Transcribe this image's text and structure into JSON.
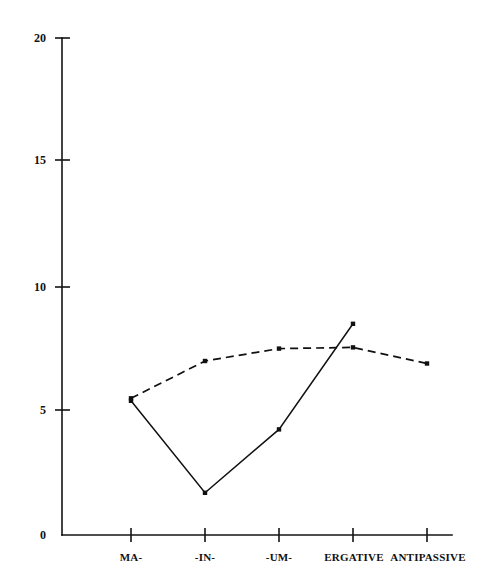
{
  "chart_data": {
    "type": "line",
    "title": "",
    "xlabel": "",
    "ylabel": "",
    "categories": [
      "MA-",
      "-IN-",
      "-UM-",
      "ERGATIVE",
      "ANTIPASSIVE"
    ],
    "ylim": [
      0,
      20
    ],
    "xlim": [
      0,
      5
    ],
    "yticks": [
      0,
      5,
      10,
      15,
      20
    ],
    "grid": false,
    "legend": "none",
    "series": [
      {
        "name": "solid",
        "style": "solid",
        "marker": "square",
        "values": [
          5.4,
          1.7,
          4.25,
          8.5,
          null
        ]
      },
      {
        "name": "dashed",
        "style": "dashed",
        "marker": "square",
        "values": [
          5.5,
          7.0,
          7.5,
          7.55,
          6.9
        ]
      }
    ]
  },
  "axis": {
    "y_tick_labels": [
      "20",
      "15",
      "10",
      "5",
      "0"
    ],
    "x_tick_labels": [
      "MA-",
      "-IN-",
      "-UM-",
      "ERGATIVE",
      "ANTIPASSIVE"
    ]
  },
  "header": {
    "title": ""
  }
}
